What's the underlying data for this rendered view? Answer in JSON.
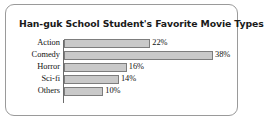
{
  "card": {
    "border_color": "#9a9a9a",
    "background": "#ffffff"
  },
  "chart_data": {
    "type": "bar",
    "orientation": "horizontal",
    "title": "Han-guk School Student's Favorite Movie Types",
    "xlabel": "",
    "ylabel": "",
    "categories": [
      "Action",
      "Comedy",
      "Horror",
      "Sci-fi",
      "Others"
    ],
    "values": [
      22,
      38,
      16,
      14,
      10
    ],
    "value_labels": [
      "22%",
      "38%",
      "16%",
      "14%",
      "10%"
    ],
    "unit": "%",
    "xlim": [
      0,
      40
    ],
    "grid": false,
    "legend": false,
    "bar_fill_color": "#c9c9c9",
    "bar_border_color": "#7d7d7d",
    "axis_color": "#6b6b6b"
  }
}
